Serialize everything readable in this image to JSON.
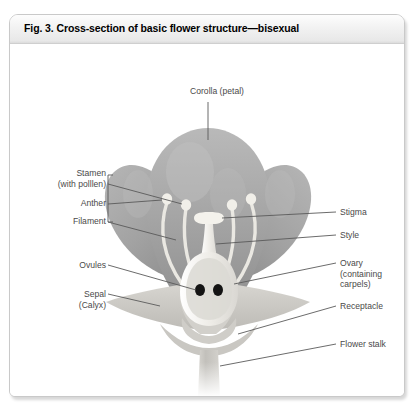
{
  "figure": {
    "title": "Fig. 3. Cross-section of basic flower structure—bisexual"
  },
  "labels": {
    "corolla": "Corolla (petal)",
    "stamen_line1": "Stamen",
    "stamen_line2": "(with polllen)",
    "anther": "Anther",
    "filament": "Filament",
    "ovules": "Ovules",
    "sepal_line1": "Sepal",
    "sepal_line2": "(Calyx)",
    "stigma": "Stigma",
    "style": "Style",
    "ovary_line1": "Ovary",
    "ovary_line2": "(containing",
    "ovary_line3": "carpels)",
    "receptacle": "Receptacle",
    "flower_stalk": "Flower stalk"
  },
  "colors": {
    "petal": "#a8a8a8",
    "petal_shade": "#8d8d8d",
    "petal_light": "#c2c2c2",
    "stamen": "#eceae4",
    "pistil": "#f0eeea",
    "ovule": "#111111",
    "sepal": "#cfcdc8",
    "stalk": "#c4c2bd",
    "leader_line": "#5a5a5a",
    "label_text": "#4a4a4a",
    "panel_border": "#c9c9c9",
    "title_text": "#000000"
  },
  "anatomy": {
    "parts": [
      "corolla",
      "stamen",
      "anther",
      "filament",
      "ovules",
      "sepal",
      "stigma",
      "style",
      "ovary",
      "receptacle",
      "flower stalk"
    ],
    "ovule_count": 2,
    "stamen_count": 4,
    "petal_count": 3,
    "flower_type": "bisexual"
  }
}
